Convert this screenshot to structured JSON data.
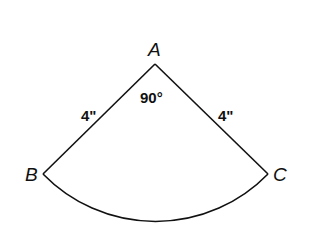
{
  "figure": {
    "type": "circular sector",
    "vertices": {
      "A": {
        "label": "A",
        "x": 155,
        "y": 64
      },
      "B": {
        "label": "B",
        "x": 43,
        "y": 174
      },
      "C": {
        "label": "C",
        "x": 268,
        "y": 174
      }
    },
    "angle_label": "90°",
    "side_AB_label": "4\"",
    "side_AC_label": "4\"",
    "stroke_color": "#111111"
  }
}
